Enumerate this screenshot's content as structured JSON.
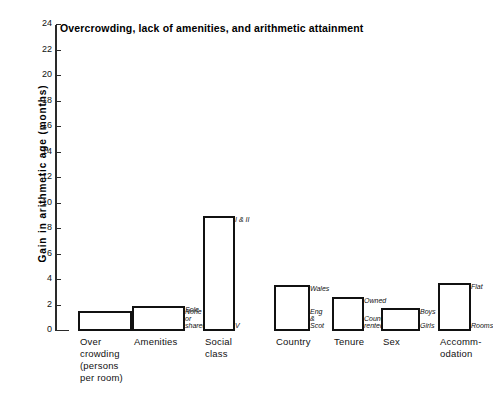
{
  "chart_data": {
    "type": "bar",
    "title": "Overcrowding, lack of amenities, and arithmetic attainment",
    "xlabel": "",
    "ylabel": "Gain in arithmetic age (months)",
    "ylim": [
      0,
      24
    ],
    "ytick_step": 2,
    "yticks": [
      "24",
      "22",
      "20",
      "18",
      "16",
      "14",
      "12",
      "10",
      "8",
      "6",
      "4",
      "2",
      "0"
    ],
    "grid": false,
    "legend": "none",
    "categories": [
      "Over crowding (persons per room)",
      "Amenities",
      "Social class",
      "Country",
      "Tenure",
      "Sex",
      "Accommodation"
    ],
    "values": [
      1.6,
      2.0,
      9.0,
      3.6,
      2.7,
      1.8,
      3.8
    ],
    "bars": [
      {
        "category_lines": [
          "Over",
          "crowding",
          "(persons",
          "per room)"
        ],
        "value": 1.6,
        "top_label": "<1.0",
        "bottom_label": ")1.5"
      },
      {
        "category_lines": [
          "Amenities"
        ],
        "value": 2.0,
        "top_label": "Sole",
        "bottom_label": "None\nor\nshared"
      },
      {
        "category_lines": [
          "Social",
          "class"
        ],
        "value": 9.0,
        "top_label": "I & II",
        "bottom_label": "V"
      },
      {
        "category_lines": [
          "Country"
        ],
        "value": 3.6,
        "top_label": "Wales",
        "bottom_label": "Eng\n&\nScot"
      },
      {
        "category_lines": [
          "Tenure"
        ],
        "value": 2.7,
        "top_label": "Owned",
        "bottom_label": "Council\nrented"
      },
      {
        "category_lines": [
          "Sex"
        ],
        "value": 1.8,
        "top_label": "Boys",
        "bottom_label": "Girls"
      },
      {
        "category_lines": [
          "Accomm-",
          "odation"
        ],
        "value": 3.8,
        "top_label": "Flat",
        "bottom_label": "Rooms"
      }
    ],
    "colors": {
      "bar_fill": "#ffffff",
      "bar_stroke": "#111111",
      "axis": "#2a2a2a",
      "text": "#111111",
      "background": "#ffffff"
    }
  }
}
